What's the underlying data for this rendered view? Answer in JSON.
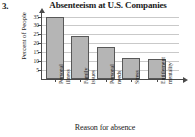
{
  "problem_number": "3.",
  "chart_data": {
    "type": "bar",
    "title": "Absenteeism at U.S. Companies",
    "xlabel": "Reason for absence",
    "ylabel": "Percent of People",
    "categories": [
      "Personal illness",
      "Family issues",
      "Personal needs",
      "Stress",
      "Entitlement mentality"
    ],
    "category_lines": [
      [
        "Personal",
        "illness"
      ],
      [
        "Family",
        "issues"
      ],
      [
        "Personal",
        "needs"
      ],
      [
        "Stress"
      ],
      [
        "Entitlement",
        "mentality"
      ]
    ],
    "values": [
      35,
      24,
      18,
      12,
      11
    ],
    "ylim": [
      0,
      37
    ],
    "yticks": [
      5,
      10,
      15,
      20,
      25,
      30,
      35
    ],
    "ytick_labels": [
      "5",
      "10",
      "15",
      "20",
      "25",
      "30",
      "35"
    ],
    "grid": true,
    "legend": "none",
    "bar_color": "#b5b5b5",
    "bar_border_color": "#585858",
    "gridline_color": "#c9c9c9",
    "axis_color": "#4a4a4a"
  }
}
